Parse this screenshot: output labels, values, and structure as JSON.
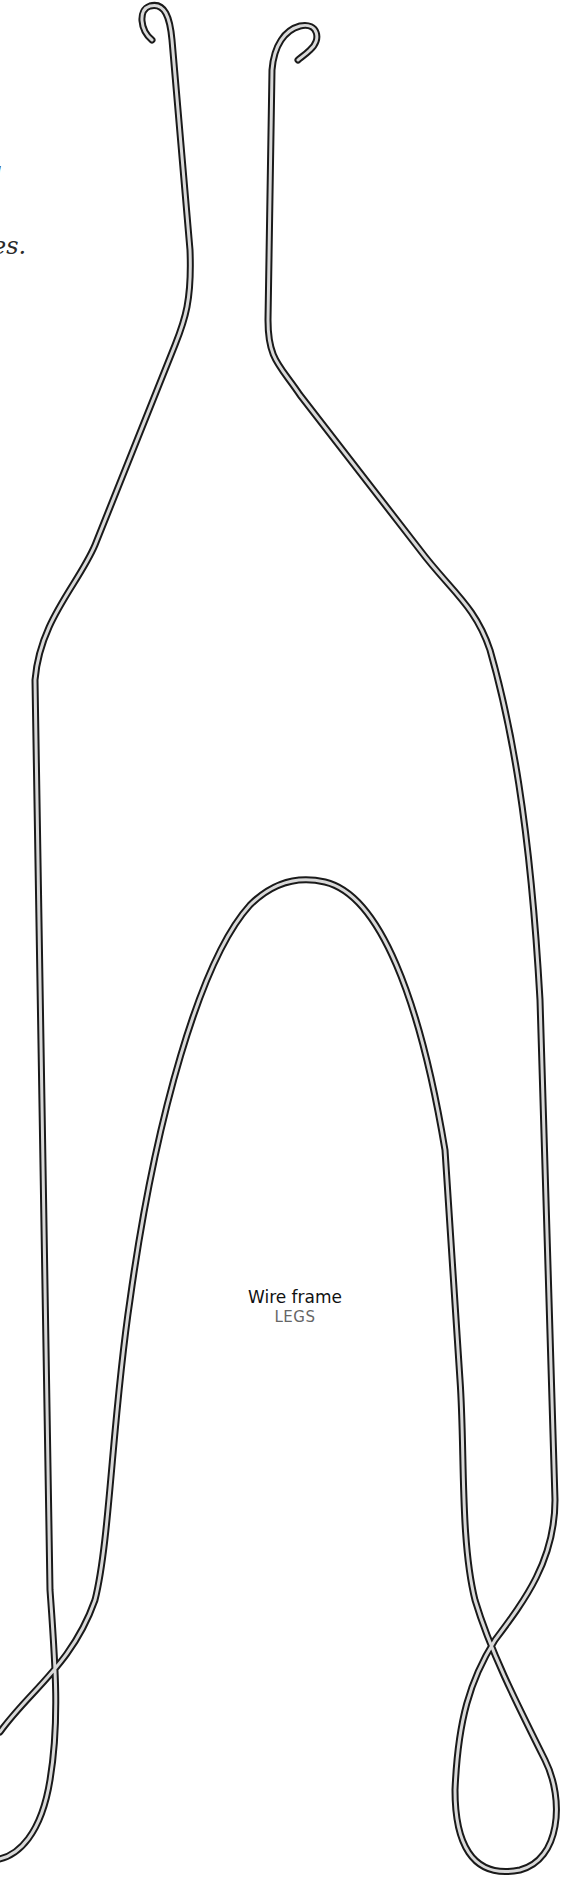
{
  "caption_fragments": [
    "l",
    "es."
  ],
  "part": {
    "name": "Wire frame",
    "category": "LEGS"
  },
  "style": {
    "wire_outline": "#1a1a1a",
    "wire_fill": "#d9d9d9",
    "background": "#ffffff"
  }
}
